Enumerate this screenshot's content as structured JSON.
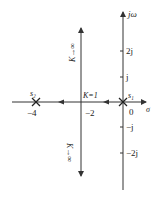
{
  "diagram": {
    "type": "root-locus",
    "axes": {
      "real_label": "σ",
      "imag_label": "jω",
      "origin_label": "0"
    },
    "imag_ticks": [
      {
        "label": "2j",
        "value": 2
      },
      {
        "label": "j",
        "value": 1
      },
      {
        "label": "−j",
        "value": -1
      },
      {
        "label": "−2j",
        "value": -2
      }
    ],
    "real_ticks": [
      {
        "label": "−4",
        "value": -4
      },
      {
        "label": "−2",
        "value": -2
      }
    ],
    "poles": [
      {
        "name": "s₁",
        "value": 0
      },
      {
        "name": "s₂",
        "value": -4
      }
    ],
    "breakaway": {
      "label": "K=1",
      "value": -2
    },
    "asymptote_labels": {
      "up": "K→∞",
      "down": "K→∞"
    },
    "colors": {
      "line": "#333333",
      "text": "#222222"
    }
  }
}
